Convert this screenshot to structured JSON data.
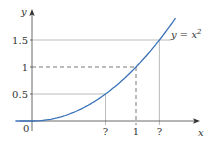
{
  "chart_data": {
    "type": "line",
    "title": "",
    "xlabel": "x",
    "ylabel": "y",
    "series": [
      {
        "name": "y = x^2",
        "label": "y = x",
        "exponent": "2",
        "color": "#3b73b9",
        "x": [
          -0.15,
          0,
          0.25,
          0.5,
          0.707,
          1,
          1.225,
          1.39
        ],
        "y": [
          0,
          0,
          0.0625,
          0.25,
          0.5,
          1,
          1.5,
          1.93
        ]
      }
    ],
    "y_ticks": [
      {
        "value": 0,
        "label": "0"
      },
      {
        "value": 0.5,
        "label": "0.5"
      },
      {
        "value": 1,
        "label": "1"
      },
      {
        "value": 1.5,
        "label": "1.5"
      }
    ],
    "x_ticks": [
      {
        "value": 0.707,
        "label": "?"
      },
      {
        "value": 1,
        "label": "1"
      },
      {
        "value": 1.225,
        "label": "?"
      }
    ],
    "guides": [
      {
        "y": 0.5,
        "x": 0.707,
        "style": "solid"
      },
      {
        "y": 1,
        "x": 1,
        "style": "dashed"
      },
      {
        "y": 1.5,
        "x": 1.225,
        "style": "solid"
      }
    ],
    "origin_label": "0",
    "grid": false,
    "legend": "none",
    "xlim": [
      -0.15,
      1.45
    ],
    "ylim": [
      0,
      2.0
    ]
  }
}
